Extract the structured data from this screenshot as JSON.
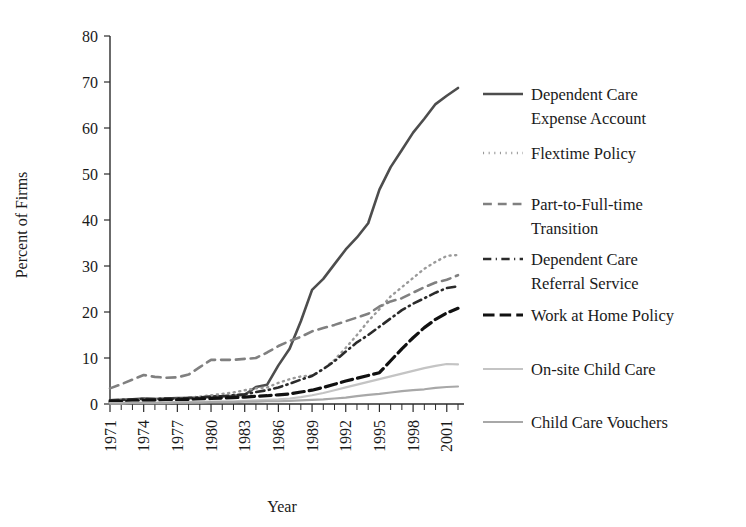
{
  "chart_data": {
    "type": "line",
    "title": "",
    "xlabel": "Year",
    "ylabel": "Percent of Firms",
    "xlim": [
      1971,
      2002
    ],
    "ylim": [
      0,
      80
    ],
    "ytick_step": 10,
    "xtick_label_step": 3,
    "grid": false,
    "legend_position": "right",
    "y_ticks": [
      "0",
      "10",
      "20",
      "30",
      "40",
      "50",
      "60",
      "70",
      "80"
    ],
    "x_ticks": [
      "1971",
      "1974",
      "1977",
      "1980",
      "1983",
      "1986",
      "1989",
      "1992",
      "1995",
      "1998",
      "2001"
    ],
    "x": [
      1971,
      1972,
      1973,
      1974,
      1975,
      1976,
      1977,
      1978,
      1979,
      1980,
      1981,
      1982,
      1983,
      1984,
      1985,
      1986,
      1987,
      1988,
      1989,
      1990,
      1991,
      1992,
      1993,
      1994,
      1995,
      1996,
      1997,
      1998,
      1999,
      2000,
      2001,
      2002
    ],
    "series": [
      {
        "name": "Dependent Care Expense Account",
        "key": "dependent-care-expense-account",
        "color": "#4d4d4d",
        "dash": "solid",
        "width": 2.6,
        "values": [
          0.8,
          0.9,
          1.0,
          1.2,
          1.1,
          1.2,
          1.3,
          1.3,
          1.4,
          1.6,
          1.7,
          1.8,
          2.0,
          3.7,
          4.2,
          8.4,
          12.0,
          18.0,
          24.8,
          27.2,
          30.4,
          33.6,
          36.2,
          39.3,
          46.6,
          51.5,
          55.2,
          59.0,
          62.0,
          65.2,
          67.0,
          68.7
        ]
      },
      {
        "name": "Flextime Policy",
        "key": "flextime-policy",
        "color": "#9a9a9a",
        "dash": "dotted",
        "width": 2.4,
        "values": [
          0.6,
          0.7,
          0.8,
          0.9,
          1.0,
          1.1,
          1.2,
          1.4,
          1.6,
          1.9,
          2.2,
          2.5,
          3.0,
          3.4,
          3.6,
          4.6,
          5.4,
          6.0,
          6.2,
          7.6,
          9.6,
          12.2,
          15.0,
          18.0,
          20.6,
          23.4,
          25.4,
          27.4,
          29.4,
          30.9,
          32.2,
          32.4
        ]
      },
      {
        "name": "Part-to-Full-time Transition",
        "key": "part-to-full-time-transition",
        "color": "#808080",
        "dash": "dashed",
        "width": 2.6,
        "values": [
          3.4,
          4.3,
          5.3,
          6.3,
          5.9,
          5.7,
          5.8,
          6.4,
          8.0,
          9.6,
          9.6,
          9.6,
          9.8,
          10.0,
          11.2,
          12.6,
          13.7,
          14.6,
          15.8,
          16.5,
          17.2,
          18.0,
          18.8,
          19.6,
          21.2,
          22.3,
          23.0,
          24.2,
          25.4,
          26.4,
          27.0,
          28.0
        ]
      },
      {
        "name": "Dependent Care Referral Service",
        "key": "dependent-care-referral-service",
        "color": "#2b2b2b",
        "dash": "dashdot",
        "width": 2.6,
        "values": [
          0.8,
          0.9,
          1.0,
          1.1,
          1.1,
          1.2,
          1.2,
          1.3,
          1.4,
          1.6,
          1.7,
          1.9,
          2.1,
          2.6,
          3.0,
          3.6,
          4.4,
          5.3,
          6.1,
          7.6,
          9.3,
          11.4,
          13.4,
          15.0,
          16.8,
          18.6,
          20.4,
          21.8,
          23.0,
          24.2,
          25.2,
          25.6
        ]
      },
      {
        "name": "Work at Home Policy",
        "key": "work-at-home-policy",
        "color": "#111111",
        "dash": "longdash",
        "width": 3.2,
        "values": [
          0.5,
          0.6,
          0.7,
          0.8,
          0.8,
          0.9,
          0.9,
          1.0,
          1.1,
          1.2,
          1.3,
          1.4,
          1.5,
          1.7,
          1.8,
          2.0,
          2.2,
          2.6,
          3.0,
          3.6,
          4.3,
          5.0,
          5.6,
          6.2,
          6.8,
          9.4,
          12.0,
          14.4,
          16.6,
          18.4,
          19.8,
          20.8
        ]
      },
      {
        "name": "On-site Child Care",
        "key": "on-site-child-care",
        "color": "#c4c4c4",
        "dash": "solid",
        "width": 2.2,
        "values": [
          0.2,
          0.2,
          0.3,
          0.3,
          0.3,
          0.4,
          0.4,
          0.4,
          0.5,
          0.5,
          0.6,
          0.6,
          0.7,
          0.8,
          0.9,
          1.0,
          1.2,
          1.5,
          1.9,
          2.4,
          3.0,
          3.6,
          4.2,
          4.8,
          5.4,
          6.0,
          6.6,
          7.2,
          7.8,
          8.3,
          8.7,
          8.6
        ]
      },
      {
        "name": "Child Care Vouchers",
        "key": "child-care-vouchers",
        "color": "#a8a8a8",
        "dash": "solid",
        "width": 2.2,
        "values": [
          0.1,
          0.1,
          0.2,
          0.2,
          0.2,
          0.2,
          0.3,
          0.3,
          0.3,
          0.4,
          0.4,
          0.4,
          0.5,
          0.5,
          0.6,
          0.6,
          0.7,
          0.8,
          0.9,
          1.0,
          1.2,
          1.4,
          1.7,
          2.0,
          2.2,
          2.5,
          2.8,
          3.0,
          3.2,
          3.5,
          3.7,
          3.8
        ]
      }
    ]
  },
  "legend": {
    "entries": [
      {
        "label_line1": "Dependent Care",
        "label_line2": "Expense Account",
        "key": "dependent-care-expense-account"
      },
      {
        "label_line1": "Flextime Policy",
        "label_line2": "",
        "key": "flextime-policy"
      },
      {
        "label_line1": "Part-to-Full-time",
        "label_line2": "Transition",
        "key": "part-to-full-time-transition"
      },
      {
        "label_line1": "Dependent Care",
        "label_line2": "Referral Service",
        "key": "dependent-care-referral-service"
      },
      {
        "label_line1": "Work at Home Policy",
        "label_line2": "",
        "key": "work-at-home-policy"
      },
      {
        "label_line1": "On-site Child Care",
        "label_line2": "",
        "key": "on-site-child-care"
      },
      {
        "label_line1": "Child Care Vouchers",
        "label_line2": "",
        "key": "child-care-vouchers"
      }
    ]
  }
}
